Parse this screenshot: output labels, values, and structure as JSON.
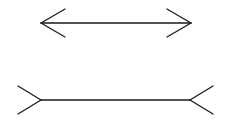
{
  "figure": {
    "stroke_color": "#1a1a1a",
    "background": "#ffffff",
    "top": {
      "kind": "arrowheads-inward",
      "x1": 41,
      "x2": 191,
      "y": 23,
      "fin_dx": 24,
      "fin_dy": 14
    },
    "bottom": {
      "kind": "fins-outward",
      "x1": 41,
      "x2": 190,
      "y": 100,
      "fin_dx": 23,
      "fin_dy": 14
    }
  }
}
